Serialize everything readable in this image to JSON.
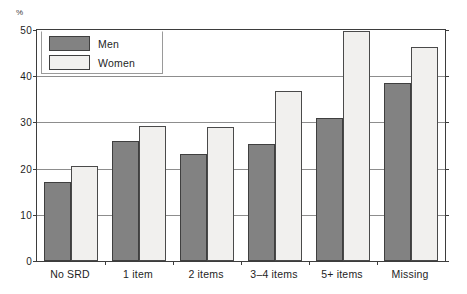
{
  "figure": {
    "cropped_title_fragment": "",
    "unit_label": "%"
  },
  "legend": {
    "position": "top-left-inside",
    "entries": [
      {
        "label": "Men",
        "color": "#828282"
      },
      {
        "label": "Women",
        "color": "#f1f0ee"
      }
    ]
  },
  "chart_data": {
    "type": "bar",
    "title": "",
    "xlabel": "",
    "ylabel": "%",
    "ylim": [
      0,
      50
    ],
    "yticks": [
      0,
      10,
      20,
      30,
      40,
      50
    ],
    "ytick_labels": [
      "0",
      "10",
      "20",
      "30",
      "40",
      "50"
    ],
    "grid": true,
    "grid_axis": "y",
    "legend_position": "upper left",
    "categories": [
      "No SRD",
      "1 item",
      "2 items",
      "3–4 items",
      "5+ items",
      "Missing"
    ],
    "series": [
      {
        "name": "Men",
        "color": "#828282",
        "values": [
          17.2,
          26.0,
          23.1,
          25.3,
          30.9,
          38.6
        ]
      },
      {
        "name": "Women",
        "color": "#f1f0ee",
        "values": [
          20.5,
          29.2,
          29.0,
          36.9,
          49.7,
          46.4
        ]
      }
    ]
  }
}
